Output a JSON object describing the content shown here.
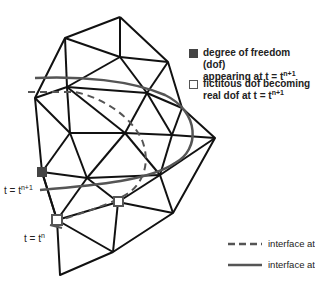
{
  "figure": {
    "type": "finite element mesh with moving interface",
    "colors": {
      "mesh": "#111111",
      "interface": "#555555",
      "filled_dof": "#444444",
      "open_dof_border": "#555555"
    }
  },
  "legend": {
    "filled_square": {
      "line1": "degree of freedom (dof)",
      "line2_prefix": "appearing at t = t",
      "line2_sup": "n+1"
    },
    "open_square": {
      "line1": "fictitous dof becoming",
      "line2_prefix": "real dof at t = t",
      "line2_sup": "n+1"
    },
    "dashed_line": {
      "prefix": "interface at t = t",
      "sup": "n"
    },
    "solid_line": {
      "prefix": "interface at t = t",
      "sup": "n+1"
    }
  },
  "annotations": {
    "t_np1": {
      "prefix": "t = t",
      "sup": "n+1"
    },
    "t_n": {
      "prefix": "t = t",
      "sup": "n"
    }
  }
}
